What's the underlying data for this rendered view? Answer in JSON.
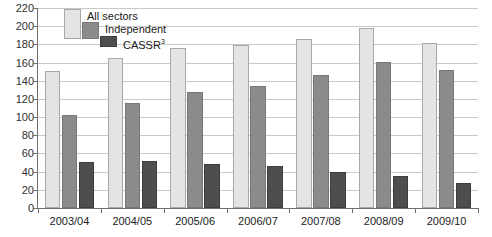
{
  "chart_data": {
    "type": "bar",
    "title": "",
    "xlabel": "",
    "ylabel": "",
    "ylim": [
      0,
      220
    ],
    "ytick_step": 20,
    "grid": true,
    "legend_position": "top-left-inside",
    "categories": [
      "2003/04",
      "2004/05",
      "2005/06",
      "2006/07",
      "2007/08",
      "2008/09",
      "2009/10"
    ],
    "series": [
      {
        "name": "All sectors",
        "color": "#e4e4e4",
        "values": [
          151,
          165,
          176,
          179,
          186,
          198,
          181
        ]
      },
      {
        "name": "Independent",
        "color": "#8b8b8b",
        "values": [
          102,
          115,
          128,
          134,
          146,
          161,
          152
        ]
      },
      {
        "name": "CASSR",
        "color": "#4e4e4e",
        "values": [
          51,
          52,
          48,
          46,
          40,
          35,
          27
        ],
        "name_superscript": "3"
      }
    ],
    "yticks": [
      "0",
      "20",
      "40",
      "60",
      "80",
      "100",
      "120",
      "140",
      "160",
      "180",
      "200",
      "220"
    ]
  },
  "legend": {
    "items": [
      {
        "label": "All sectors",
        "sup": ""
      },
      {
        "label": "Independent",
        "sup": ""
      },
      {
        "label": "CASSR",
        "sup": "3"
      }
    ]
  },
  "colors": {
    "all_sectors": "#e4e4e4",
    "independent": "#8b8b8b",
    "cassr": "#4e4e4e",
    "gridline": "#c9c9c9",
    "axis": "#6f6f6f",
    "text": "#222222",
    "background": "#ffffff"
  }
}
